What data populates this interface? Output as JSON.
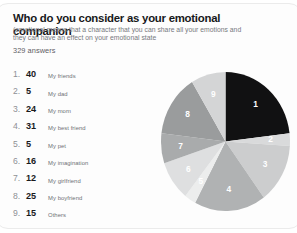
{
  "card": {
    "title": "Who do you consider as your emotional companion",
    "subtitle": "(emotional means that a character that you can share all your emotions and they can have an effect on your emotional state",
    "answers": "329 answers"
  },
  "legend": {
    "items": [
      {
        "rank": "1.",
        "count": "40",
        "label": "My friends"
      },
      {
        "rank": "2.",
        "count": "5",
        "label": "My dad"
      },
      {
        "rank": "3.",
        "count": "24",
        "label": "My mom"
      },
      {
        "rank": "4.",
        "count": "31",
        "label": "My best friend"
      },
      {
        "rank": "5.",
        "count": "5",
        "label": "My pet"
      },
      {
        "rank": "6.",
        "count": "16",
        "label": "My imagination"
      },
      {
        "rank": "7.",
        "count": "12",
        "label": "My girlfriend"
      },
      {
        "rank": "8.",
        "count": "25",
        "label": "My boyfriend"
      },
      {
        "rank": "9.",
        "count": "15",
        "label": "Others"
      }
    ]
  },
  "chart_data": {
    "type": "pie",
    "title": "Who do you consider as your emotional companion",
    "total_answers": 329,
    "sum_of_slices": 173,
    "start_angle_deg": 0,
    "direction": "clockwise",
    "labels_shown": "slice index number",
    "legend": "external ranked list at left",
    "categories": [
      "My friends",
      "My dad",
      "My mom",
      "My best friend",
      "My pet",
      "My imagination",
      "My girlfriend",
      "My boyfriend",
      "Others"
    ],
    "slice_numbers": [
      "1",
      "2",
      "3",
      "4",
      "5",
      "6",
      "7",
      "8",
      "9"
    ],
    "values": [
      40,
      5,
      24,
      31,
      5,
      16,
      12,
      25,
      15
    ],
    "colors": [
      "#111112",
      "#d9dadb",
      "#cccdce",
      "#b0b2b3",
      "#eceded",
      "#dedfe0",
      "#a9abac",
      "#9a9c9d",
      "#d4d5d6"
    ]
  },
  "palette": {
    "card_background": "#fdfdfd",
    "card_border": "#ebebeb",
    "title_color": "#17181a",
    "subtitle_color": "#77797d",
    "count_color": "#191a1c",
    "rank_color": "#8e9095",
    "label_color": "#6e7176",
    "slice_label_color": "#ffffff"
  }
}
